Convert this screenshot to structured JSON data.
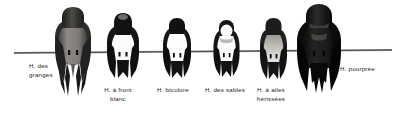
{
  "figure": {
    "background_color": "#ffffff",
    "width": 400,
    "height": 113,
    "wire": {
      "name": "perch-wire",
      "color": "#4a4a4a",
      "x_start": 14,
      "x_end": 392,
      "y": 52
    }
  },
  "birds": [
    {
      "id": "barn-swallow",
      "label_line1": "H. des",
      "label_line2": "granges",
      "label_x": 29,
      "label_y": 62,
      "x": 51,
      "y": 6,
      "width": 44,
      "height": 92,
      "plumage": {
        "crown": "#2b2b2b",
        "back": "#3a3a3a",
        "underside": "#8d8a85",
        "wing": "#222222"
      },
      "tail": "long-forked"
    },
    {
      "id": "cliff-swallow",
      "label_line1": "H. à front",
      "label_line2": "blanc",
      "label_x": 99,
      "label_y": 86,
      "x": 104,
      "y": 12,
      "width": 38,
      "height": 72,
      "plumage": {
        "crown": "#161616",
        "back": "#202020",
        "underside": "#ffffff",
        "wing": "#111111"
      },
      "tail": "square"
    },
    {
      "id": "tree-swallow",
      "label_line1": "H. bicolore",
      "label_line2": "",
      "label_x": 152,
      "label_y": 86,
      "x": 160,
      "y": 17,
      "width": 34,
      "height": 65,
      "plumage": {
        "crown": "#141414",
        "back": "#1d1d1d",
        "underside": "#ffffff",
        "wing": "#111111"
      },
      "tail": "notched"
    },
    {
      "id": "bank-swallow",
      "label_line1": "H. des sables",
      "label_line2": "",
      "label_x": 198,
      "label_y": 86,
      "x": 211,
      "y": 19,
      "width": 31,
      "height": 62,
      "plumage": {
        "crown": "#151515",
        "back": "#1f1f1f",
        "underside": "#ffffff",
        "wing": "#111111"
      },
      "tail": "notched"
    },
    {
      "id": "rough-winged-swallow",
      "label_line1": "H. à ailes",
      "label_line2": "hérissées",
      "label_x": 246,
      "label_y": 86,
      "x": 257,
      "y": 17,
      "width": 33,
      "height": 66,
      "plumage": {
        "crown": "#1a1a1a",
        "back": "#272727",
        "underside": "#b9b6b1",
        "wing": "#141414"
      },
      "tail": "square"
    },
    {
      "id": "purple-martin",
      "label_line1": "H. pourprée",
      "label_line2": "",
      "label_x": 338,
      "label_y": 66,
      "x": 293,
      "y": 3,
      "width": 52,
      "height": 93,
      "plumage": {
        "crown": "#0d0d0d",
        "back": "#121212",
        "underside": "#1a1a1a",
        "wing": "#060606"
      },
      "tail": "long-notched"
    }
  ]
}
